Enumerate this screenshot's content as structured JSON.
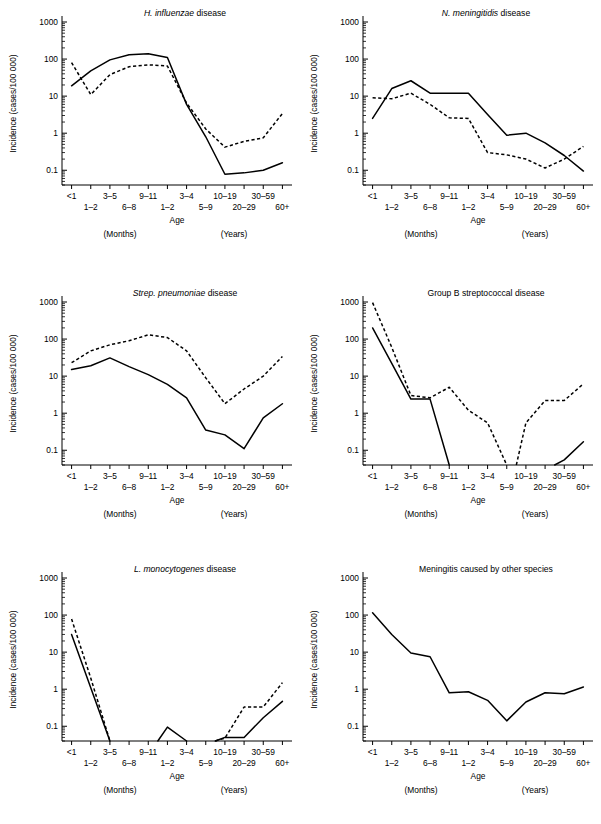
{
  "figure": {
    "axis": {
      "x_label": "Age",
      "x_group_left": "(Months)",
      "x_group_right": "(Years)",
      "y_label": "Incidence (cases/100 000)",
      "categories": [
        "<1",
        "1–2",
        "3–5",
        "6–8",
        "9–11",
        "1–2",
        "3–4",
        "5–9",
        "10–19",
        "20–29",
        "30–59",
        "60+"
      ],
      "tick_labels_top": [
        "<1",
        "3–5",
        "9–11",
        "3–4",
        "10–19",
        "30–59"
      ],
      "tick_labels_bottom": [
        "1–2",
        "6–8",
        "1–2",
        "5–9",
        "20–29",
        "60+"
      ],
      "y_tick_labels": [
        "1000",
        "100",
        "10",
        "1",
        "0.1"
      ],
      "y_tick_values": [
        1000,
        100,
        10,
        1,
        0.1
      ],
      "ylim": [
        0.04,
        1000
      ],
      "y_scale": "log"
    },
    "stroke_color": "#000000",
    "background": "#ffffff"
  },
  "chart_data": [
    {
      "type": "line",
      "panel": 1,
      "title_italic": "H. influenzae",
      "title_roman": " disease",
      "title": "H. influenzae disease",
      "xlabel": "Age",
      "ylabel": "Incidence (cases/100 000)",
      "ylim": [
        0.04,
        1000
      ],
      "y_scale": "log",
      "grid": false,
      "legend": "none",
      "categories": [
        "<1",
        "1–2",
        "3–5",
        "6–8",
        "9–11",
        "1–2",
        "3–4",
        "5–9",
        "10–19",
        "20–29",
        "30–59",
        "60+"
      ],
      "series": [
        {
          "name": "solid",
          "style": "solid",
          "values": [
            19,
            48,
            95,
            130,
            140,
            110,
            6,
            0.8,
            0.078,
            0.085,
            0.1,
            0.16
          ]
        },
        {
          "name": "dashed",
          "style": "dashed",
          "values": [
            80,
            11,
            38,
            62,
            70,
            65,
            6.5,
            1.3,
            0.42,
            0.6,
            0.75,
            3.4
          ]
        }
      ]
    },
    {
      "type": "line",
      "panel": 2,
      "title_italic": "N. meningitidis",
      "title_roman": " disease",
      "title": "N. meningitidis disease",
      "xlabel": "Age",
      "ylabel": "Incidence (cases/100 000)",
      "ylim": [
        0.04,
        1000
      ],
      "y_scale": "log",
      "grid": false,
      "legend": "none",
      "categories": [
        "<1",
        "1–2",
        "3–5",
        "6–8",
        "9–11",
        "1–2",
        "3–4",
        "5–9",
        "10–19",
        "20–29",
        "30–59",
        "60+"
      ],
      "series": [
        {
          "name": "solid",
          "style": "solid",
          "values": [
            2.5,
            16,
            26,
            12,
            12,
            12,
            3.2,
            0.88,
            1.0,
            0.55,
            0.25,
            0.095
          ]
        },
        {
          "name": "dashed",
          "style": "dashed",
          "values": [
            9,
            8.5,
            12,
            6,
            2.6,
            2.5,
            0.3,
            0.26,
            0.2,
            0.115,
            0.2,
            0.44
          ]
        }
      ]
    },
    {
      "type": "line",
      "panel": 3,
      "title_italic": "Strep. pneumoniae",
      "title_roman": " disease",
      "title": "Strep. pneumoniae disease",
      "xlabel": "Age",
      "ylabel": "Incidence (cases/100 000)",
      "ylim": [
        0.04,
        1000
      ],
      "y_scale": "log",
      "grid": false,
      "legend": "none",
      "categories": [
        "<1",
        "1–2",
        "3–5",
        "6–8",
        "9–11",
        "1–2",
        "3–4",
        "5–9",
        "10–19",
        "20–29",
        "30–59",
        "60+"
      ],
      "series": [
        {
          "name": "solid",
          "style": "solid",
          "values": [
            15,
            19,
            31,
            18,
            11,
            6,
            2.6,
            0.35,
            0.26,
            0.11,
            0.75,
            1.8
          ]
        },
        {
          "name": "dashed",
          "style": "dashed",
          "values": [
            23,
            48,
            70,
            90,
            130,
            110,
            48,
            9,
            1.8,
            4.5,
            10,
            34
          ]
        }
      ]
    },
    {
      "type": "line",
      "panel": 4,
      "title_italic": "",
      "title_roman": "Group B streptococcal disease",
      "title": "Group B streptococcal disease",
      "xlabel": "Age",
      "ylabel": "Incidence (cases/100 000)",
      "ylim": [
        0.04,
        1000
      ],
      "y_scale": "log",
      "grid": false,
      "legend": "none",
      "categories": [
        "<1",
        "1–2",
        "3–5",
        "6–8",
        "9–11",
        "1–2",
        "3–4",
        "5–9",
        "10–19",
        "20–29",
        "30–59",
        "60+"
      ],
      "series": [
        {
          "name": "solid",
          "style": "solid",
          "values": [
            200,
            22,
            2.4,
            2.4,
            null,
            null,
            null,
            null,
            null,
            null,
            0.055,
            0.17
          ]
        },
        {
          "name": "dashed",
          "style": "dashed",
          "values": [
            960,
            60,
            3.0,
            2.6,
            5.0,
            1.2,
            0.55,
            null,
            0.55,
            2.2,
            2.2,
            6.2
          ]
        }
      ]
    },
    {
      "type": "line",
      "panel": 5,
      "title_italic": "L. monocytogenes",
      "title_roman": " disease",
      "title": "L. monocytogenes disease",
      "xlabel": "Age",
      "ylabel": "Incidence (cases/100 000)",
      "ylim": [
        0.04,
        1000
      ],
      "y_scale": "log",
      "grid": false,
      "legend": "none",
      "categories": [
        "<1",
        "1–2",
        "3–5",
        "6–8",
        "9–11",
        "1–2",
        "3–4",
        "5–9",
        "10–19",
        "20–29",
        "30–59",
        "60+"
      ],
      "series": [
        {
          "name": "solid",
          "style": "solid",
          "values": [
            30,
            1.1,
            null,
            null,
            null,
            0.095,
            null,
            null,
            0.05,
            0.05,
            0.17,
            0.47
          ]
        },
        {
          "name": "dashed",
          "style": "dashed",
          "values": [
            78,
            2.0,
            null,
            null,
            null,
            null,
            null,
            null,
            0.048,
            0.33,
            0.33,
            1.5
          ]
        }
      ]
    },
    {
      "type": "line",
      "panel": 6,
      "title_italic": "",
      "title_roman": "Meningitis caused by other species",
      "title": "Meningitis caused by other species",
      "xlabel": "Age",
      "ylabel": "Incidence (cases/100 000)",
      "ylim": [
        0.04,
        1000
      ],
      "y_scale": "log",
      "grid": false,
      "legend": "none",
      "categories": [
        "<1",
        "1–2",
        "3–5",
        "6–8",
        "9–11",
        "1–2",
        "3–4",
        "5–9",
        "10–19",
        "20–29",
        "30–59",
        "60+"
      ],
      "series": [
        {
          "name": "solid",
          "style": "solid",
          "values": [
            115,
            30,
            9.5,
            7.5,
            0.8,
            0.85,
            0.5,
            0.14,
            0.45,
            0.8,
            0.75,
            1.15
          ]
        }
      ]
    }
  ],
  "panel_positions": [
    {
      "left": 0,
      "top": 0
    },
    {
      "left": 301,
      "top": 0
    },
    {
      "left": 0,
      "top": 280
    },
    {
      "left": 301,
      "top": 280
    },
    {
      "left": 0,
      "top": 556
    },
    {
      "left": 301,
      "top": 556
    }
  ]
}
